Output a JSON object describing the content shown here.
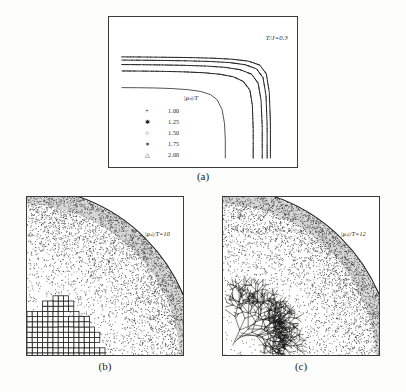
{
  "figure": {
    "panels": [
      {
        "id": "a",
        "caption": "(a)",
        "annotation": "T/J=0.3",
        "legend": {
          "title": "|μₛ|/T",
          "entries": [
            {
              "marker": "+",
              "marker_name": "plus-marker",
              "value": "1.00"
            },
            {
              "marker": "✱",
              "marker_name": "asterisk-filled-marker",
              "value": "1.25"
            },
            {
              "marker": "○",
              "marker_name": "open-circle-marker",
              "value": "1.50"
            },
            {
              "marker": "∗",
              "marker_name": "asterisk-marker",
              "value": "1.75"
            },
            {
              "marker": "△",
              "marker_name": "open-triangle-marker",
              "value": "2.00"
            }
          ]
        }
      },
      {
        "id": "b",
        "caption": "(b)",
        "annotation": "|μₛ|/T=10"
      },
      {
        "id": "c",
        "caption": "(c)",
        "annotation": "|μₛ|/T=12"
      }
    ]
  },
  "chart_data": [
    {
      "type": "line",
      "panel": "a",
      "title": "",
      "subtitle": "T/J=0.3",
      "xlabel": "",
      "ylabel": "",
      "xlim": [
        0,
        1
      ],
      "ylim": [
        0,
        1
      ],
      "grid": false,
      "legend_position": "inside-center-left",
      "legend_title": "|μₛ|/T",
      "description": "Five nested rounded-corner equilibrium crystal shape contours in the first quadrant; each curve is flat along the top, turns through a rounded corner, and drops vertically to the bottom axis. Larger |μₛ|/T gives a larger, squarer shape.",
      "series": [
        {
          "name": "1.00",
          "marker": "+",
          "plateau_y": 0.55,
          "corner_x": 0.62,
          "x": [
            0.0,
            0.1,
            0.2,
            0.3,
            0.4,
            0.48,
            0.54,
            0.58,
            0.61,
            0.625,
            0.63,
            0.63
          ],
          "y": [
            0.55,
            0.549,
            0.547,
            0.543,
            0.534,
            0.52,
            0.495,
            0.455,
            0.38,
            0.27,
            0.14,
            0.0
          ]
        },
        {
          "name": "1.25",
          "marker": "✱",
          "plateau_y": 0.68,
          "corner_x": 0.8,
          "x": [
            0.0,
            0.12,
            0.25,
            0.38,
            0.5,
            0.6,
            0.68,
            0.74,
            0.78,
            0.795,
            0.8,
            0.8
          ],
          "y": [
            0.68,
            0.679,
            0.677,
            0.673,
            0.666,
            0.654,
            0.634,
            0.598,
            0.53,
            0.41,
            0.22,
            0.0
          ]
        },
        {
          "name": "1.50",
          "marker": "○",
          "plateau_y": 0.73,
          "corner_x": 0.855,
          "x": [
            0.0,
            0.12,
            0.25,
            0.38,
            0.52,
            0.63,
            0.72,
            0.79,
            0.83,
            0.848,
            0.855,
            0.855
          ],
          "y": [
            0.73,
            0.729,
            0.727,
            0.724,
            0.718,
            0.708,
            0.69,
            0.655,
            0.585,
            0.45,
            0.24,
            0.0
          ]
        },
        {
          "name": "1.75",
          "marker": "∗",
          "plateau_y": 0.765,
          "corner_x": 0.885,
          "x": [
            0.0,
            0.12,
            0.26,
            0.4,
            0.54,
            0.66,
            0.75,
            0.82,
            0.86,
            0.878,
            0.885,
            0.885
          ],
          "y": [
            0.765,
            0.764,
            0.762,
            0.759,
            0.754,
            0.745,
            0.729,
            0.697,
            0.628,
            0.487,
            0.26,
            0.0
          ]
        },
        {
          "name": "2.00",
          "marker": "△",
          "plateau_y": 0.79,
          "corner_x": 0.905,
          "x": [
            0.0,
            0.12,
            0.26,
            0.4,
            0.55,
            0.67,
            0.77,
            0.84,
            0.88,
            0.898,
            0.905,
            0.905
          ],
          "y": [
            0.79,
            0.789,
            0.787,
            0.785,
            0.78,
            0.772,
            0.757,
            0.726,
            0.658,
            0.514,
            0.275,
            0.0
          ]
        }
      ]
    },
    {
      "type": "scatter",
      "panel": "b",
      "title": "",
      "subtitle": "|μₛ|/T=10",
      "xlabel": "",
      "ylabel": "",
      "grid": false,
      "description": "Monte Carlo snapshot of a growing cluster in a quarter-disc geometry. A dense speckled vapour phase fills the quarter disc with density decreasing toward the centre; a compact, blocky, faceted solid cluster with ragged outline occupies the lower-left corner region.",
      "cluster_style": "compact-blocky",
      "quarter_radius": 1.0,
      "cluster_extent": 0.42
    },
    {
      "type": "scatter",
      "panel": "c",
      "title": "",
      "subtitle": "|μₛ|/T=12",
      "xlabel": "",
      "ylabel": "",
      "grid": false,
      "description": "Monte Carlo snapshot at higher supersaturation. The same quarter-disc speckled vapour field surrounds a branched, tip-splitting dendritic cluster that extends from the lower-left corner with thin fingers reaching outward.",
      "cluster_style": "dendritic-branched",
      "quarter_radius": 1.0,
      "cluster_extent": 0.55
    }
  ]
}
